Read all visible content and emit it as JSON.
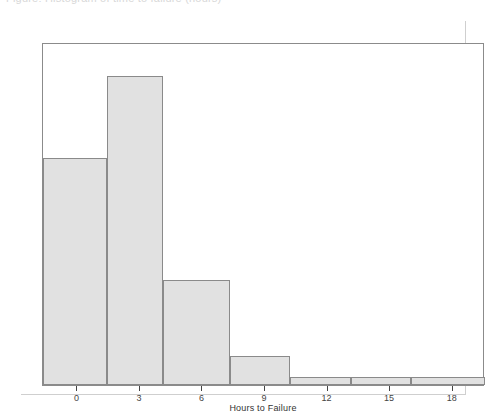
{
  "caption": {
    "text": "Figure: Histogram of time to failure (hours)"
  },
  "chart_data": {
    "type": "bar",
    "title": "",
    "subtitle": "",
    "xlabel": "Hours to Failure",
    "ylabel": "",
    "grid": false,
    "legend": null,
    "legend_position": "none",
    "xlim": [
      -1.65,
      19.55
    ],
    "ylim": [
      0,
      1.0
    ],
    "x_ticks": [
      0,
      3,
      6,
      9,
      12,
      15,
      18
    ],
    "x_tick_labels": [
      "0",
      "3",
      "6",
      "9",
      "12",
      "15",
      "18"
    ],
    "y_ticks": [],
    "y_tick_labels": [],
    "bin_edges": [
      -1.65,
      1.4,
      4.1,
      7.3,
      10.2,
      13.1,
      16.0,
      19.55
    ],
    "bin_labels": [
      "-1.65 to 1.4",
      "1.4 to 4.1",
      "4.1 to 7.3",
      "7.3 to 10.2",
      "10.2 to 13.1",
      "13.1 to 16.0",
      "16.0 to 19.55"
    ],
    "categories": [
      "0",
      "3",
      "6",
      "9",
      "12",
      "15",
      "18"
    ],
    "values": [
      0.735,
      1.0,
      0.34,
      0.094,
      0.026,
      0.026,
      0.026
    ],
    "bar_pixel_heights": [
      227,
      309,
      105,
      29,
      8,
      8,
      8
    ],
    "colors": {
      "bar_fill": "#e1e1e1",
      "bar_edge": "#8a8a8a",
      "frame": "#8b8b8b",
      "axis_text": "#444444",
      "background": "#ffffff"
    }
  }
}
